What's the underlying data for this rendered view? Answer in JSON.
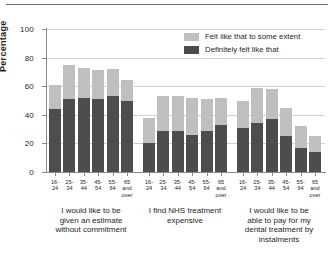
{
  "chart_data": {
    "type": "bar",
    "title": "",
    "subtitle": "",
    "xlabel": "",
    "ylabel": "Percentage",
    "ylim": [
      0,
      100
    ],
    "yticks": [
      0,
      20,
      40,
      60,
      80,
      100
    ],
    "grid": true,
    "stacked": true,
    "legend_position": "top-right",
    "categories": [
      "16-24",
      "25-34",
      "35-44",
      "45-54",
      "55-64",
      "65 and over"
    ],
    "category_lines": [
      [
        "16-",
        "24"
      ],
      [
        "25-",
        "34"
      ],
      [
        "35-",
        "44"
      ],
      [
        "45-",
        "54"
      ],
      [
        "55-",
        "64"
      ],
      [
        "65",
        "and",
        "over"
      ]
    ],
    "series": [
      {
        "name": "Definitely felt like that",
        "color": "#4d4d4d"
      },
      {
        "name": "Felt like that to some extent",
        "color": "#bfbfbf"
      }
    ],
    "groups": [
      {
        "label": "I would like to be given an estimate without commitment",
        "label_lines": [
          "I would like to be",
          "given an estimate",
          "without commitment"
        ],
        "definitely": [
          44,
          51,
          52,
          51,
          53,
          50
        ],
        "some_extent": [
          17,
          24,
          21,
          20,
          19,
          14
        ],
        "totals": [
          61,
          75,
          73,
          71,
          72,
          64
        ]
      },
      {
        "label": "I find NHS treatment expensive",
        "label_lines": [
          "I find NHS treatment",
          "expensive"
        ],
        "definitely": [
          20,
          29,
          29,
          26,
          29,
          33
        ],
        "some_extent": [
          18,
          24,
          24,
          26,
          22,
          19
        ],
        "totals": [
          38,
          53,
          53,
          52,
          51,
          52
        ]
      },
      {
        "label": "I would like to be able to pay for my dental treatment by instalments",
        "label_lines": [
          "I would like to be",
          "able to pay for my",
          "dental treatment by",
          "instalments"
        ],
        "definitely": [
          31,
          34,
          37,
          25,
          17,
          14
        ],
        "some_extent": [
          19,
          25,
          21,
          20,
          15,
          11
        ],
        "totals": [
          50,
          59,
          58,
          45,
          32,
          25
        ]
      }
    ]
  },
  "legend": {
    "items": [
      {
        "label": "Felt like that to some extent",
        "swatch": "light"
      },
      {
        "label": "Definitely felt like that",
        "swatch": "dark"
      }
    ]
  },
  "axis": {
    "y_title": "Percentage",
    "y_tick_labels": [
      "0",
      "20",
      "40",
      "60",
      "80",
      "100"
    ]
  }
}
